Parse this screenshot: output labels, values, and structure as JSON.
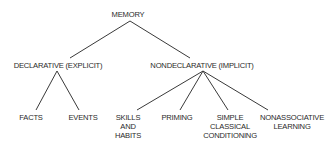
{
  "diagram": {
    "type": "tree",
    "root": {
      "id": "memory",
      "label": "MEMORY",
      "children": [
        {
          "id": "declarative",
          "label": "DECLARATIVE (EXPLICIT)",
          "children": [
            {
              "id": "facts",
              "label": "FACTS"
            },
            {
              "id": "events",
              "label": "EVENTS"
            }
          ]
        },
        {
          "id": "nondeclarative",
          "label": "NONDECLARATIVE (IMPLICIT)",
          "children": [
            {
              "id": "skills",
              "label": "SKILLS AND HABITS",
              "lines": [
                "SKILLS",
                "AND",
                "HABITS"
              ]
            },
            {
              "id": "priming",
              "label": "PRIMING"
            },
            {
              "id": "classical",
              "label": "SIMPLE CLASSICAL CONDITIONING",
              "lines": [
                "SIMPLE",
                "CLASSICAL",
                "CONDITIONING"
              ]
            },
            {
              "id": "nonassociative",
              "label": "NONASSOCIATIVE LEARNING",
              "lines": [
                "NONASSOCIATIVE",
                "LEARNING"
              ]
            }
          ]
        }
      ]
    }
  },
  "nodes": {
    "memory": "MEMORY",
    "declarative": "DECLARATIVE (EXPLICIT)",
    "nondeclarative": "NONDECLARATIVE (IMPLICIT)",
    "facts": "FACTS",
    "events": "EVENTS",
    "skills": [
      "SKILLS",
      "AND",
      "HABITS"
    ],
    "priming": "PRIMING",
    "classical": [
      "SIMPLE",
      "CLASSICAL",
      "CONDITIONING"
    ],
    "nonassociative": [
      "NONASSOCIATIVE",
      "LEARNING"
    ]
  },
  "colors": {
    "line": "#3a3a3a",
    "text": "#2a2a2a",
    "background": "#ffffff"
  }
}
